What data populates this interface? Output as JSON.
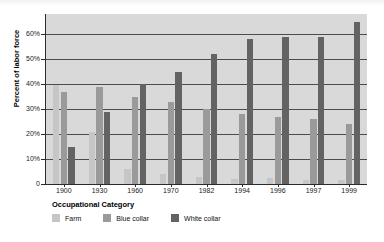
{
  "top_banner": {
    "ghost_text": ""
  },
  "legend": {
    "title": "Occupational Category",
    "items": [
      {
        "label": "Farm",
        "color": "#c6c6c6",
        "key": "farm"
      },
      {
        "label": "Blue collar",
        "color": "#9a9a9a",
        "key": "blue"
      },
      {
        "label": "White collar",
        "color": "#636363",
        "key": "white"
      }
    ]
  },
  "chart_data": {
    "type": "bar",
    "title": "",
    "xlabel": "",
    "ylabel": "Percent of labor force",
    "categories": [
      "1900",
      "1930",
      "1960",
      "1970",
      "1982",
      "1994",
      "1996",
      "1997",
      "1999"
    ],
    "series": [
      {
        "name": "Farm",
        "color": "#c6c6c6",
        "values": [
          39.5,
          21.0,
          6.0,
          4.0,
          2.8,
          2.0,
          2.3,
          1.8,
          1.8
        ]
      },
      {
        "name": "Blue collar",
        "color": "#9a9a9a",
        "values": [
          37.0,
          39.0,
          35.0,
          33.0,
          30.0,
          28.0,
          27.0,
          26.0,
          24.0
        ]
      },
      {
        "name": "White collar",
        "color": "#636363",
        "values": [
          15.0,
          29.0,
          40.0,
          45.0,
          52.0,
          58.0,
          59.0,
          59.0,
          65.0
        ]
      }
    ],
    "ylim": [
      0,
      68
    ],
    "yticks": [
      0,
      10,
      20,
      30,
      40,
      50,
      60
    ],
    "ytick_labels": [
      "0",
      "10%",
      "20%",
      "30%",
      "40%",
      "50%",
      "60%"
    ],
    "grid": "horizontal",
    "legend_position": "bottom-left",
    "plot_background": "#d9d9d9"
  }
}
